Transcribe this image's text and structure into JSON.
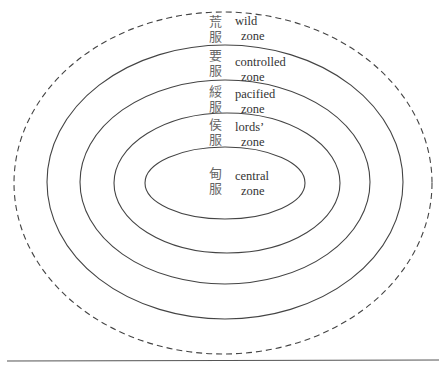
{
  "diagram": {
    "type": "concentric-zones",
    "center": {
      "x": 225,
      "y": 183
    },
    "colors": {
      "line": "#444444",
      "text": "#333333",
      "background": "#ffffff"
    },
    "zones": [
      {
        "id": "wild",
        "cjk": [
          "荒",
          "服"
        ],
        "en": [
          "wild",
          "zone"
        ],
        "rx": 208,
        "ry": 171,
        "stroke": "dashed"
      },
      {
        "id": "controlled",
        "cjk": [
          "要",
          "服"
        ],
        "en": [
          "controlled",
          "zone"
        ],
        "rx": 178,
        "ry": 137,
        "stroke": "solid"
      },
      {
        "id": "pacified",
        "cjk": [
          "綏",
          "服"
        ],
        "en": [
          "pacified",
          "zone"
        ],
        "rx": 145,
        "ry": 102,
        "stroke": "solid"
      },
      {
        "id": "lords",
        "cjk": [
          "侯",
          "服"
        ],
        "en": [
          "lords’",
          "zone"
        ],
        "rx": 113,
        "ry": 70,
        "stroke": "solid"
      },
      {
        "id": "central",
        "cjk": [
          "甸",
          "服"
        ],
        "en": [
          "central",
          "zone"
        ],
        "rx": 80,
        "ry": 36,
        "stroke": "solid"
      }
    ]
  }
}
